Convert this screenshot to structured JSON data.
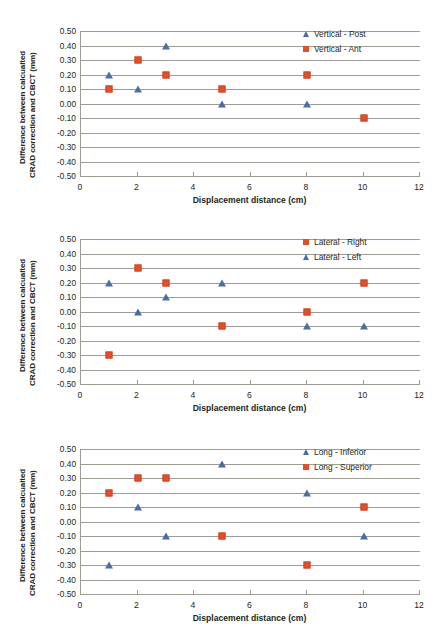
{
  "figure": {
    "panel_count": 3,
    "marker_colors": {
      "triangle_blue": "#4a6ea4",
      "square_orange": "#e0502a"
    },
    "grid_color": "#9d9d96",
    "background": "#ffffff"
  },
  "chart_data": [
    {
      "type": "scatter",
      "title": "",
      "xlabel": "Displacement distance (cm)",
      "ylabel_line1": "Difference between calcualted",
      "ylabel_line2": "CRAD correction and CBCT (mm)",
      "xlim": [
        0,
        12
      ],
      "ylim": [
        -0.5,
        0.5
      ],
      "xticks": [
        0,
        2,
        4,
        6,
        8,
        10,
        12
      ],
      "xtick_labels": [
        "0",
        "2",
        "4",
        "6",
        "8",
        "10",
        "12"
      ],
      "yticks": [
        0.5,
        0.4,
        0.3,
        0.2,
        0.1,
        0.0,
        -0.1,
        -0.2,
        -0.3,
        -0.4,
        -0.5
      ],
      "ytick_labels": [
        "0.50",
        "0.40",
        "0.30",
        "0.20",
        "0.10",
        "0.00",
        "-0.10",
        "-0.20",
        "-0.30",
        "-0.40",
        "-0.50"
      ],
      "grid": true,
      "legend_position": "top-right",
      "series": [
        {
          "name": "Vertical - Post",
          "marker": "triangle",
          "color": "#4a6ea4",
          "x": [
            1,
            2,
            3,
            5,
            8
          ],
          "values": [
            0.2,
            0.1,
            0.4,
            0.0,
            0.0
          ]
        },
        {
          "name": "Vertical - Ant",
          "marker": "square",
          "color": "#e0502a",
          "x": [
            1,
            2,
            3,
            5,
            8,
            10
          ],
          "values": [
            0.1,
            0.3,
            0.2,
            0.1,
            0.2,
            -0.1
          ]
        }
      ]
    },
    {
      "type": "scatter",
      "title": "",
      "xlabel": "Displacement distance (cm)",
      "ylabel_line1": "Difference between calcualted",
      "ylabel_line2": "CRAD correction and CBCT (mm)",
      "xlim": [
        0,
        12
      ],
      "ylim": [
        -0.5,
        0.5
      ],
      "xticks": [
        0,
        2,
        4,
        6,
        8,
        10,
        12
      ],
      "xtick_labels": [
        "0",
        "2",
        "4",
        "6",
        "8",
        "10",
        "12"
      ],
      "yticks": [
        0.5,
        0.4,
        0.3,
        0.2,
        0.1,
        0.0,
        -0.1,
        -0.2,
        -0.3,
        -0.4,
        -0.5
      ],
      "ytick_labels": [
        "0.50",
        "0.40",
        "0.30",
        "0.20",
        "0.10",
        "0.00",
        "-0.10",
        "-0.20",
        "-0.30",
        "-0.40",
        "-0.50"
      ],
      "grid": true,
      "legend_position": "top-right",
      "series": [
        {
          "name": "Lateral - Right",
          "marker": "square",
          "color": "#e0502a",
          "x": [
            1,
            2,
            3,
            5,
            8,
            10
          ],
          "values": [
            -0.3,
            0.3,
            0.2,
            -0.1,
            0.0,
            0.2
          ]
        },
        {
          "name": "Lateral - Left",
          "marker": "triangle",
          "color": "#4a6ea4",
          "x": [
            1,
            2,
            3,
            5,
            8,
            10
          ],
          "values": [
            0.2,
            0.0,
            0.1,
            0.2,
            -0.1,
            -0.1
          ]
        }
      ]
    },
    {
      "type": "scatter",
      "title": "",
      "xlabel": "Displacement distance (cm)",
      "ylabel_line1": "Difference between calcualted",
      "ylabel_line2": "CRAD correction and CBCT (mm)",
      "xlim": [
        0,
        12
      ],
      "ylim": [
        -0.5,
        0.5
      ],
      "xticks": [
        0,
        2,
        4,
        6,
        8,
        10,
        12
      ],
      "xtick_labels": [
        "0",
        "2",
        "4",
        "6",
        "8",
        "10",
        "12"
      ],
      "yticks": [
        0.5,
        0.4,
        0.3,
        0.2,
        0.1,
        0.0,
        -0.1,
        -0.2,
        -0.3,
        -0.4,
        -0.5
      ],
      "ytick_labels": [
        "0.50",
        "0.40",
        "0.30",
        "0.20",
        "0.10",
        "0.00",
        "-0.10",
        "-0.20",
        "-0.30",
        "-0.40",
        "-0.50"
      ],
      "grid": true,
      "legend_position": "top-right",
      "series": [
        {
          "name": "Long - Inferior",
          "marker": "triangle",
          "color": "#4a6ea4",
          "x": [
            1,
            2,
            3,
            5,
            8,
            10
          ],
          "values": [
            -0.3,
            0.1,
            -0.1,
            0.4,
            0.2,
            -0.1
          ]
        },
        {
          "name": "Long - Superior",
          "marker": "square",
          "color": "#e0502a",
          "x": [
            1,
            2,
            3,
            5,
            8,
            10
          ],
          "values": [
            0.2,
            0.3,
            0.3,
            -0.1,
            -0.3,
            0.1
          ]
        }
      ]
    }
  ]
}
